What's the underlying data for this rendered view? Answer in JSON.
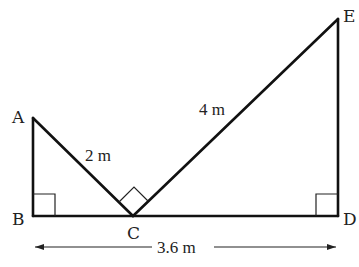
{
  "diagram": {
    "type": "geometry",
    "points": {
      "A": {
        "label": "A",
        "x": 33,
        "y": 118
      },
      "B": {
        "label": "B",
        "x": 33,
        "y": 216
      },
      "C": {
        "label": "C",
        "x": 133,
        "y": 216
      },
      "D": {
        "label": "D",
        "x": 338,
        "y": 216
      },
      "E": {
        "label": "E",
        "x": 338,
        "y": 19
      }
    },
    "segments": [
      {
        "from": "A",
        "to": "B"
      },
      {
        "from": "B",
        "to": "D"
      },
      {
        "from": "A",
        "to": "C"
      },
      {
        "from": "C",
        "to": "E"
      },
      {
        "from": "D",
        "to": "E"
      }
    ],
    "right_angles": [
      "B",
      "C",
      "D"
    ],
    "measurements": {
      "AC": "2 m",
      "CE": "4 m",
      "BD": "3.6 m"
    }
  }
}
